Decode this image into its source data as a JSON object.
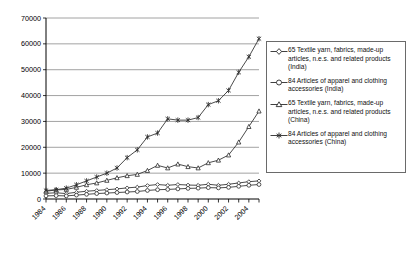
{
  "chart_data": {
    "type": "line",
    "title": "",
    "xlabel": "",
    "ylabel": "",
    "ylim": [
      0,
      70000
    ],
    "ytick_values": [
      0,
      10000,
      20000,
      30000,
      40000,
      50000,
      60000,
      70000
    ],
    "ytick_labels": [
      "0",
      "10000",
      "20000",
      "30000",
      "40000",
      "50000",
      "60000",
      "70000"
    ],
    "grid": "horizontal",
    "legend_position": "right",
    "x": [
      1984,
      1985,
      1986,
      1987,
      1988,
      1989,
      1990,
      1991,
      1992,
      1993,
      1994,
      1995,
      1996,
      1997,
      1998,
      1999,
      2000,
      2001,
      2002,
      2003,
      2004,
      2005
    ],
    "xtick_labels": [
      "1984",
      "1986",
      "1988",
      "1990",
      "1992",
      "1994",
      "1996",
      "1998",
      "2000",
      "2002",
      "2004"
    ],
    "xtick_values": [
      1984,
      1986,
      1988,
      1990,
      1992,
      1994,
      1996,
      1998,
      2000,
      2002,
      2004
    ],
    "series": [
      {
        "name": "65 Textile yarn, fabrics, made-up articles, n.e.s. and related products (India)",
        "marker": "diamond",
        "values": [
          2200,
          2400,
          2100,
          2600,
          3000,
          3300,
          3600,
          3900,
          4300,
          4600,
          5200,
          5600,
          5300,
          5600,
          5400,
          5300,
          5700,
          5300,
          5700,
          6200,
          6700,
          7000
        ]
      },
      {
        "name": "84 Articles of apparel and clothing accessories (India)",
        "marker": "circle",
        "values": [
          1200,
          1300,
          1200,
          1500,
          1800,
          2100,
          2300,
          2500,
          2700,
          2900,
          3300,
          3600,
          3700,
          3900,
          4100,
          4200,
          4400,
          4300,
          4500,
          4900,
          5300,
          5600
        ]
      },
      {
        "name": "65 Textile yarn, fabrics, made-up articles, n.e.s. and related products (China)",
        "marker": "triangle",
        "values": [
          3000,
          3500,
          3700,
          4500,
          5500,
          6200,
          7200,
          8200,
          9000,
          9500,
          11000,
          13000,
          12000,
          13500,
          12500,
          12000,
          14000,
          15000,
          17000,
          22000,
          28000,
          34000
        ]
      },
      {
        "name": "84 Articles of apparel and clothing accessories (China)",
        "marker": "star",
        "values": [
          3300,
          3600,
          4200,
          5500,
          7000,
          8500,
          10000,
          12000,
          16000,
          19000,
          24000,
          25500,
          31000,
          30500,
          30500,
          31500,
          36500,
          38000,
          42000,
          49000,
          55000,
          62000
        ]
      }
    ]
  },
  "legend": {
    "entries": [
      {
        "marker": "diamond-marker-icon",
        "label": "65 Textile yarn, fabrics, made-up articles, n.e.s. and related products (India)"
      },
      {
        "marker": "circle-marker-icon",
        "label": "84 Articles of apparel and clothing accessories (India)"
      },
      {
        "marker": "triangle-marker-icon",
        "label": "65 Textile yarn, fabrics, made-up articles, n.e.s. and related products (China)"
      },
      {
        "marker": "star-marker-icon",
        "label": "84 Articles of apparel and clothing accessories (China)"
      }
    ]
  },
  "colors": {
    "line": "#2b2b2b",
    "grid": "#8a8a8a",
    "axis": "#000000",
    "background": "#ffffff"
  }
}
